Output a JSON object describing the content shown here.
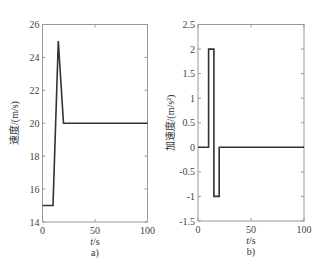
{
  "chart_data": [
    {
      "type": "line",
      "panel": "a)",
      "title": "",
      "xlabel": "t/s",
      "ylabel": "速度/(m/s)",
      "xlim": [
        0,
        100
      ],
      "ylim": [
        14,
        26
      ],
      "xticks": [
        0,
        50,
        100
      ],
      "yticks": [
        14,
        16,
        18,
        20,
        22,
        24,
        26
      ],
      "grid": false,
      "legend": null,
      "series": [
        {
          "name": "速度",
          "x": [
            0,
            10,
            15,
            20,
            100
          ],
          "y": [
            15,
            15,
            25,
            20,
            20
          ]
        }
      ]
    },
    {
      "type": "line",
      "panel": "b)",
      "title": "",
      "xlabel": "t/s",
      "ylabel": "加速度/(m/s²)",
      "xlim": [
        0,
        100
      ],
      "ylim": [
        -1.5,
        2.5
      ],
      "xticks": [
        0,
        50,
        100
      ],
      "yticks": [
        -1.5,
        -1,
        -0.5,
        0,
        0.5,
        1,
        1.5,
        2,
        2.5
      ],
      "grid": false,
      "legend": null,
      "series": [
        {
          "name": "加速度",
          "x": [
            0,
            10,
            10,
            15,
            15,
            20,
            20,
            100
          ],
          "y": [
            0,
            0,
            2,
            2,
            -1,
            -1,
            0,
            0
          ]
        }
      ]
    }
  ],
  "panels": [
    {
      "caption": "a)",
      "xlabel_italic": "t",
      "xlabel_unit": "/s",
      "ylabel": "速度/(m/s)",
      "ytick_labels": [
        "14",
        "16",
        "18",
        "20",
        "22",
        "24",
        "26"
      ],
      "xtick_labels": [
        "0",
        "50",
        "100"
      ]
    },
    {
      "caption": "b)",
      "xlabel_italic": "t",
      "xlabel_unit": "/s",
      "ylabel": "加速度/(m/s²)",
      "ytick_labels": [
        "-1.5",
        "-1",
        "-0.5",
        "0",
        "0.5",
        "1",
        "1.5",
        "2",
        "2.5"
      ],
      "xtick_labels": [
        "0",
        "50",
        "100"
      ]
    }
  ],
  "colors": {
    "line": "#333333",
    "axis": "#999999"
  }
}
